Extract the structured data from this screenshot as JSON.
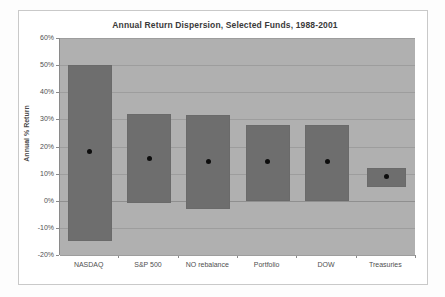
{
  "chart_data": {
    "type": "bar",
    "title": "Annual Return Dispersion, Selected Funds, 1988-2001",
    "xlabel": "",
    "ylabel": "Annual % Return",
    "ylim": [
      -20,
      60
    ],
    "ytick_labels": [
      "60%",
      "50%",
      "40%",
      "30%",
      "20%",
      "10%",
      "0%",
      "-10%",
      "-20%"
    ],
    "ytick_values": [
      60,
      50,
      40,
      30,
      20,
      10,
      0,
      -10,
      -20
    ],
    "grid": true,
    "legend": "none",
    "categories": [
      "NASDAQ",
      "S&P 500",
      "NO rebalance",
      "Portfolio",
      "DOW",
      "Treasuries"
    ],
    "series": [
      {
        "name": "Range (low to high annual return)",
        "low": [
          -15,
          -1,
          -3,
          0,
          0,
          5
        ],
        "high": [
          50,
          32,
          31.5,
          28,
          28,
          12
        ]
      },
      {
        "name": "Average annual return",
        "values": [
          18,
          15.5,
          14.5,
          14.5,
          14.5,
          9
        ]
      }
    ],
    "colors": {
      "bar_fill": "#6e6e6e",
      "plot_background": "#b0b0b0",
      "marker": "#0d0d0d",
      "gridline": "#9d9d9d",
      "title_text": "#3a3a3a"
    }
  }
}
